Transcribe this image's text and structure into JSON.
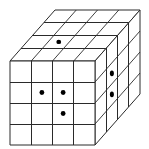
{
  "diagram": {
    "type": "cube-grid",
    "grid_size": 4,
    "colors": {
      "background": "#ffffff",
      "line": "#2a2a2a",
      "dot": "#000000"
    },
    "geometry": {
      "front_origin": [
        10,
        61
      ],
      "front_size": [
        85,
        84
      ],
      "depth_vector": [
        45,
        -51
      ]
    },
    "faces": {
      "top": {
        "dots": [
          {
            "col": 1,
            "row_from_front": 1
          }
        ]
      },
      "front": {
        "dots": [
          {
            "col": 1,
            "row": 1
          },
          {
            "col": 2,
            "row": 1
          },
          {
            "col": 2,
            "row": 2
          }
        ]
      },
      "right": {
        "dots": [
          {
            "col_from_front": 1,
            "row": 1
          },
          {
            "col_from_front": 1,
            "row": 2
          }
        ]
      }
    },
    "dot_count": 6
  }
}
